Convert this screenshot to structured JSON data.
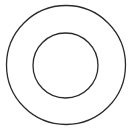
{
  "diagram": {
    "background": "#ffffff",
    "stroke_color": "#2a2a2a",
    "shapes": [
      {
        "type": "circle",
        "name": "outer-circle",
        "cx": 66,
        "cy": 65,
        "r": 59.5,
        "stroke_width": 1.3
      },
      {
        "type": "circle",
        "name": "inner-circle",
        "cx": 65.5,
        "cy": 65.5,
        "r": 32.5,
        "stroke_width": 1.3
      }
    ]
  }
}
